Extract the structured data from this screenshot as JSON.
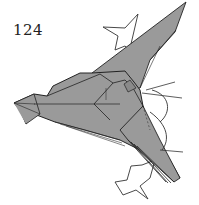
{
  "step": {
    "number": "124"
  },
  "caption": {
    "text": ""
  },
  "colors": {
    "paper": "#9a9a9a",
    "paper_dark": "#7d7d7d",
    "line": "#222222",
    "arrow_fill": "#ffffff",
    "background": "#ffffff"
  },
  "diagram": {
    "arrows": [
      "upper-push-arrow",
      "lower-push-arrow",
      "upper-curved-arrow",
      "lower-curved-arrow"
    ]
  }
}
